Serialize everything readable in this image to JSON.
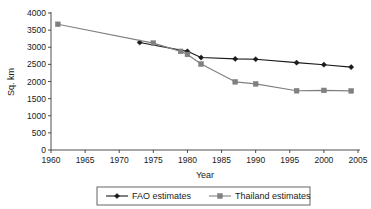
{
  "chart_data": {
    "type": "line",
    "title": "",
    "xlabel": "Year",
    "ylabel": "Sq. km",
    "xlim": [
      1960,
      2005
    ],
    "ylim": [
      0,
      4000
    ],
    "xticks": [
      1960,
      1965,
      1970,
      1975,
      1980,
      1985,
      1990,
      1995,
      2000,
      2005
    ],
    "yticks": [
      0,
      500,
      1000,
      1500,
      2000,
      2500,
      3000,
      3500,
      4000
    ],
    "grid": false,
    "legend_position": "bottom",
    "series": [
      {
        "name": "FAO estimates",
        "color": "#1a1a1a",
        "marker": "diamond",
        "points": [
          {
            "x": 1973,
            "y": 3140
          },
          {
            "x": 1980,
            "y": 2880
          },
          {
            "x": 1982,
            "y": 2700
          },
          {
            "x": 1987,
            "y": 2660
          },
          {
            "x": 1990,
            "y": 2650
          },
          {
            "x": 1996,
            "y": 2550
          },
          {
            "x": 2000,
            "y": 2490
          },
          {
            "x": 2004,
            "y": 2420
          }
        ]
      },
      {
        "name": "Thailand estimates",
        "color": "#808080",
        "marker": "square",
        "points": [
          {
            "x": 1961,
            "y": 3670
          },
          {
            "x": 1975,
            "y": 3120
          },
          {
            "x": 1979,
            "y": 2880
          },
          {
            "x": 1980,
            "y": 2790
          },
          {
            "x": 1982,
            "y": 2510
          },
          {
            "x": 1987,
            "y": 1990
          },
          {
            "x": 1990,
            "y": 1930
          },
          {
            "x": 1996,
            "y": 1730
          },
          {
            "x": 2000,
            "y": 1740
          },
          {
            "x": 2004,
            "y": 1725
          }
        ]
      }
    ]
  },
  "axis": {
    "y_title": "Sq. km",
    "x_title": "Year",
    "x_tick_labels": [
      "1960",
      "1965",
      "1970",
      "1975",
      "1980",
      "1985",
      "1990",
      "1995",
      "2000",
      "2005"
    ],
    "y_tick_labels": [
      "0",
      "500",
      "1000",
      "1500",
      "2000",
      "2500",
      "3000",
      "3500",
      "4000"
    ]
  },
  "legend": {
    "entries": [
      {
        "label": "FAO estimates",
        "color": "#1a1a1a",
        "marker": "diamond"
      },
      {
        "label": "Thailand estimates",
        "color": "#808080",
        "marker": "square"
      }
    ]
  },
  "colors": {
    "fao": "#1a1a1a",
    "thailand": "#808080",
    "axis": "#3a3a3a",
    "background": "#ffffff"
  }
}
